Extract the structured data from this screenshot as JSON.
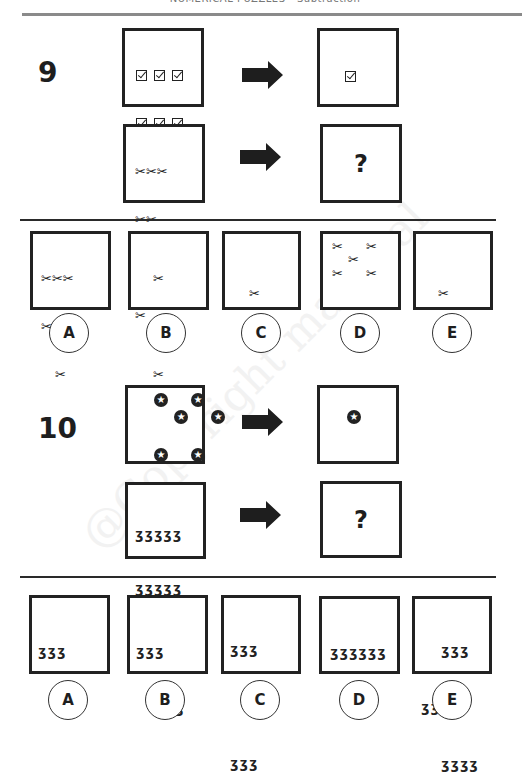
{
  "header": {
    "title": "NUMERICAL PUZZLES - Subtraction",
    "rule_color": "#8a8a8a"
  },
  "watermark": "@Copyright material",
  "questions": [
    {
      "number": "9",
      "row1": {
        "left_icon": "checkbox-icon",
        "left_count": 9,
        "left_layout": "3x3 grid",
        "right_icon": "checkbox-icon",
        "right_count": 3,
        "right_layout": "1 column of 3"
      },
      "row2": {
        "left_icon": "scissors-icon",
        "left_count": 7,
        "left_layout": "rows of 3, 2, 1, 1",
        "right_text": "?"
      },
      "options": [
        {
          "letter": "A",
          "icon": "scissors-icon",
          "count": 6,
          "layout": "rows of 3, 2, 1"
        },
        {
          "letter": "B",
          "icon": "scissors-icon",
          "count": 3,
          "layout": "1 column of 3"
        },
        {
          "letter": "C",
          "icon": "scissors-icon",
          "count": 1,
          "layout": "single"
        },
        {
          "letter": "D",
          "icon": "scissors-icon",
          "count": 5,
          "layout": "dice five"
        },
        {
          "letter": "E",
          "icon": "scissors-icon",
          "count": 2,
          "layout": "1 column of 2"
        }
      ]
    },
    {
      "number": "10",
      "row1": {
        "left_icon": "star-circle-icon",
        "left_count": 6,
        "left_layout": "rows of 2, 2, 2 staggered",
        "right_icon": "star-circle-icon",
        "right_count": 1,
        "right_layout": "single"
      },
      "row2": {
        "left_icon": "hook-icon",
        "left_count": 15,
        "left_layout": "3 rows of 5",
        "right_text": "?"
      },
      "options": [
        {
          "letter": "A",
          "icon": "hook-icon",
          "count": 5,
          "layout": "rows of 3, 2"
        },
        {
          "letter": "B",
          "icon": "hook-icon",
          "count": 6,
          "layout": "rows of 3, 3"
        },
        {
          "letter": "C",
          "icon": "hook-icon",
          "count": 8,
          "layout": "rows of 3, 2, 3"
        },
        {
          "letter": "D",
          "icon": "hook-icon",
          "count": 6,
          "layout": "row of 6"
        },
        {
          "letter": "E",
          "icon": "hook-icon",
          "count": 10,
          "layout": "rows of 3, 3, 4"
        }
      ]
    }
  ],
  "glyphs": {
    "scissors": "✂",
    "hook": "ʒ",
    "question": "?"
  }
}
